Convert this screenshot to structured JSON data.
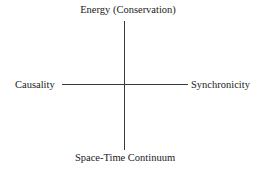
{
  "diagram": {
    "type": "quadrant-axes",
    "axes": {
      "vertical": {
        "top_label": "Energy (Conservation)",
        "bottom_label": "Space-Time Continuum"
      },
      "horizontal": {
        "left_label": "Causality",
        "right_label": "Synchronicity"
      }
    },
    "colors": {
      "line": "#3a3a3a",
      "text": "#1a1a1a",
      "background": "#ffffff"
    }
  }
}
